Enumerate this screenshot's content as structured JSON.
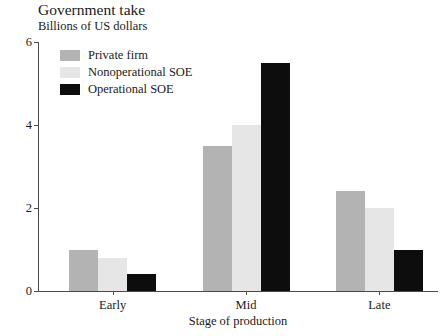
{
  "chart_data": {
    "type": "bar",
    "title": "Government take",
    "subtitle": "Billions of US dollars",
    "xlabel": "Stage of production",
    "ylabel": "",
    "ylim": [
      0,
      6
    ],
    "yticks": [
      0,
      2,
      4,
      6
    ],
    "ytick_labels": [
      "0",
      "2",
      "4",
      "6"
    ],
    "grid": false,
    "legend_position": "upper-left-inside",
    "categories": [
      "Early",
      "Mid",
      "Late"
    ],
    "series": [
      {
        "name": "Private firm",
        "color": "#b3b3b3",
        "values": [
          1.0,
          3.5,
          2.4
        ]
      },
      {
        "name": "Nonoperational SOE",
        "color": "#e6e6e6",
        "values": [
          0.8,
          4.0,
          2.0
        ]
      },
      {
        "name": "Operational SOE",
        "color": "#0d0d0d",
        "values": [
          0.4,
          5.5,
          1.0
        ]
      }
    ]
  }
}
